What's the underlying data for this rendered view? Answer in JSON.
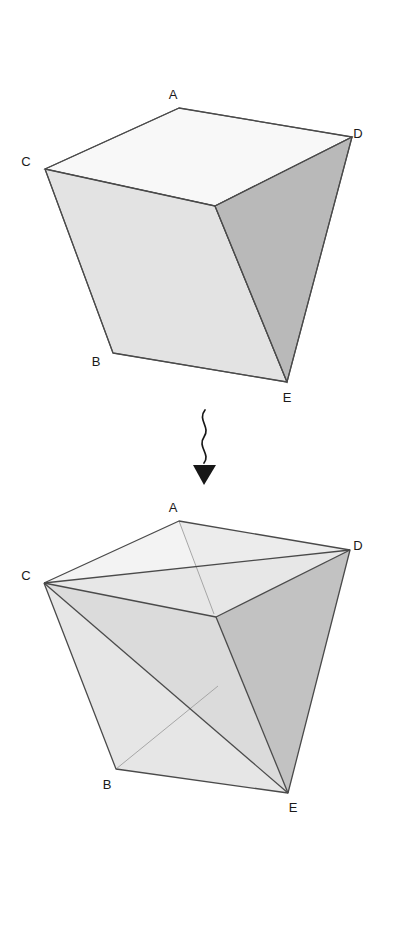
{
  "figure": {
    "title": "",
    "background_color": "#ffffff",
    "vertex_labels": [
      "A",
      "B",
      "C",
      "D",
      "E"
    ],
    "stroke_color": "#4a4a4a",
    "faint_stroke_color": "#9a9a9a",
    "label_color": "#1a1a1a",
    "face_colors": {
      "top": "#f8f8f8",
      "left": "#e3e3e3",
      "right": "#b9b9b9",
      "front_light": "#e8e8e8",
      "front_mid": "#dcdcdc",
      "right_mid": "#c6c6c6"
    }
  },
  "top_figure": {
    "name": "original-solid",
    "labels": [
      {
        "text": "A",
        "x": 173,
        "y": 99
      },
      {
        "text": "B",
        "x": 96,
        "y": 366
      },
      {
        "text": "C",
        "x": 26,
        "y": 166
      },
      {
        "text": "D",
        "x": 353,
        "y": 138
      },
      {
        "text": "E",
        "x": 282,
        "y": 401
      }
    ],
    "vertices": {
      "A": [
        179,
        108
      ],
      "B": [
        113,
        353
      ],
      "C": [
        45,
        169
      ],
      "D": [
        352,
        137
      ],
      "E": [
        287,
        382
      ],
      "M": [
        215,
        206
      ]
    },
    "faces": [
      {
        "name": "top-face",
        "points": "179,108 352,137 215,206 45,169",
        "fill": "#f8f8f8"
      },
      {
        "name": "left-face",
        "points": "45,169 215,206 287,382 113,353",
        "fill": "#e3e3e3"
      },
      {
        "name": "right-face",
        "points": "215,206 352,137 287,382",
        "fill": "#b9b9b9"
      }
    ],
    "edges": [
      "45,169 179,108",
      "179,108 352,137",
      "352,137 287,382",
      "287,382 113,353",
      "113,353 45,169",
      "45,169 215,206",
      "215,206 352,137",
      "215,206 287,382"
    ]
  },
  "connector": {
    "name": "wavy-down-arrow",
    "path": "M 204,412 C 198,422 210,428 204,438 C 198,448 210,454 204,464",
    "arrowhead": "194,466 214,466 204,484",
    "color": "#171717"
  },
  "bottom_figure": {
    "name": "triangulated-solid",
    "labels": [
      {
        "text": "A",
        "x": 173,
        "y": 512
      },
      {
        "text": "B",
        "x": 103,
        "y": 788
      },
      {
        "text": "C",
        "x": 25,
        "y": 580
      },
      {
        "text": "D",
        "x": 352,
        "y": 551
      },
      {
        "text": "E",
        "x": 288,
        "y": 811
      }
    ],
    "vertices": {
      "A": [
        179,
        521
      ],
      "B": [
        116,
        769
      ],
      "C": [
        44,
        583
      ],
      "D": [
        350,
        550
      ],
      "E": [
        288,
        793
      ],
      "M": [
        216,
        617
      ]
    },
    "faces": [
      {
        "name": "top-left-tri",
        "points": "44,583 179,521 216,617",
        "fill": "#f4f4f4"
      },
      {
        "name": "top-right-tri",
        "points": "179,521 350,550 216,617",
        "fill": "#ededed"
      },
      {
        "name": "mid-band-tri",
        "points": "44,583 216,617 350,550",
        "fill": "#e9e9e9"
      },
      {
        "name": "left-upper-tri",
        "points": "44,583 216,617 288,793",
        "fill": "#dedede"
      },
      {
        "name": "left-lower-tri",
        "points": "44,583 288,793 116,769",
        "fill": "#e6e6e6"
      },
      {
        "name": "right-face-tri",
        "points": "216,617 350,550 288,793",
        "fill": "#c2c2c2"
      },
      {
        "name": "right-outer-tri",
        "points": "350,550 288,793 288,793",
        "fill": "#cacaca"
      }
    ],
    "edges": [
      "44,583 179,521",
      "179,521 350,550",
      "350,550 288,793",
      "288,793 116,769",
      "116,769 44,583",
      "44,583 350,550",
      "44,583 216,617",
      "44,583 288,793",
      "216,617 350,550",
      "216,617 288,793",
      "179,521 350,550"
    ],
    "faint_edges": [
      "179,521 216,617",
      "116,769 216,690"
    ]
  }
}
